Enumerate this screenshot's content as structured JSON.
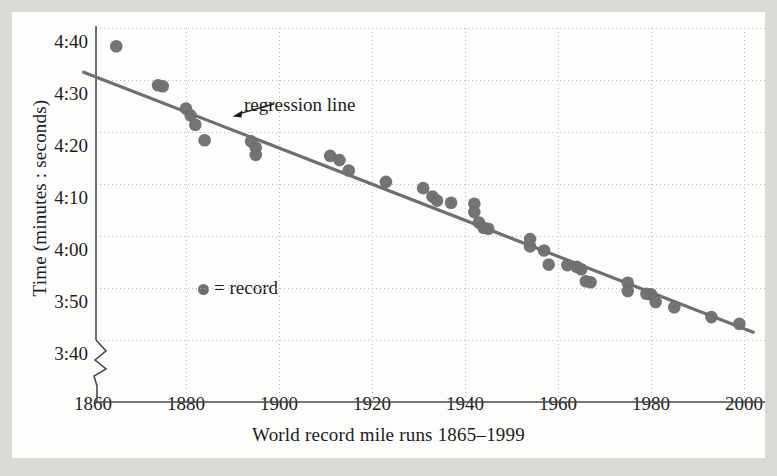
{
  "chart_data": {
    "type": "scatter",
    "title": "",
    "xlabel": "World record mile runs 1865–1999",
    "ylabel": "Time (minutes : seconds)",
    "xlim": [
      1857,
      2003
    ],
    "ylim_seconds": [
      215,
      285
    ],
    "ytick_labels": [
      "4:40",
      "4:30",
      "4:20",
      "4:10",
      "4:00",
      "3:50",
      "3:40"
    ],
    "ytick_seconds": [
      280,
      270,
      260,
      250,
      240,
      230,
      220
    ],
    "xtick_labels": [
      "1860",
      "1880",
      "1900",
      "1920",
      "1940",
      "1960",
      "1980",
      "2000"
    ],
    "xtick_values": [
      1860,
      1880,
      1900,
      1920,
      1940,
      1960,
      1980,
      2000
    ],
    "grid": true,
    "y_axis_break": true,
    "legend": {
      "position": "inside-left",
      "entries": [
        {
          "marker": "filled-circle",
          "label": "= record",
          "color": "#6f6f6f"
        }
      ]
    },
    "annotations": [
      {
        "text": "regression line",
        "x": 1898,
        "y_seconds": 265,
        "arrow_to_x": 1890,
        "arrow_to_y_seconds": 263
      }
    ],
    "series": [
      {
        "name": "record",
        "marker": "filled-circle",
        "color": "#6f6f6f",
        "points": [
          {
            "year": 1865,
            "time": "4:36.5",
            "seconds": 276.5
          },
          {
            "year": 1874,
            "time": "4:29.0",
            "seconds": 269.0
          },
          {
            "year": 1875,
            "time": "4:28.8",
            "seconds": 268.8
          },
          {
            "year": 1880,
            "time": "4:24.5",
            "seconds": 264.5
          },
          {
            "year": 1881,
            "time": "4:23.2",
            "seconds": 263.2
          },
          {
            "year": 1882,
            "time": "4:21.4",
            "seconds": 261.4
          },
          {
            "year": 1884,
            "time": "4:18.4",
            "seconds": 258.4
          },
          {
            "year": 1894,
            "time": "4:18.2",
            "seconds": 258.2
          },
          {
            "year": 1895,
            "time": "4:17.0",
            "seconds": 257.0
          },
          {
            "year": 1895,
            "time": "4:15.6",
            "seconds": 255.6
          },
          {
            "year": 1911,
            "time": "4:15.4",
            "seconds": 255.4
          },
          {
            "year": 1913,
            "time": "4:14.6",
            "seconds": 254.6
          },
          {
            "year": 1915,
            "time": "4:12.6",
            "seconds": 252.6
          },
          {
            "year": 1923,
            "time": "4:10.4",
            "seconds": 250.4
          },
          {
            "year": 1931,
            "time": "4:09.2",
            "seconds": 249.2
          },
          {
            "year": 1933,
            "time": "4:07.6",
            "seconds": 247.6
          },
          {
            "year": 1934,
            "time": "4:06.8",
            "seconds": 246.8
          },
          {
            "year": 1937,
            "time": "4:06.4",
            "seconds": 246.4
          },
          {
            "year": 1942,
            "time": "4:06.2",
            "seconds": 246.2
          },
          {
            "year": 1942,
            "time": "4:04.6",
            "seconds": 244.6
          },
          {
            "year": 1943,
            "time": "4:02.6",
            "seconds": 242.6
          },
          {
            "year": 1944,
            "time": "4:01.6",
            "seconds": 241.6
          },
          {
            "year": 1945,
            "time": "4:01.4",
            "seconds": 241.4
          },
          {
            "year": 1954,
            "time": "3:59.4",
            "seconds": 239.4
          },
          {
            "year": 1954,
            "time": "3:58.0",
            "seconds": 238.0
          },
          {
            "year": 1957,
            "time": "3:57.2",
            "seconds": 237.2
          },
          {
            "year": 1958,
            "time": "3:54.5",
            "seconds": 234.5
          },
          {
            "year": 1962,
            "time": "3:54.4",
            "seconds": 234.4
          },
          {
            "year": 1964,
            "time": "3:54.1",
            "seconds": 234.1
          },
          {
            "year": 1965,
            "time": "3:53.6",
            "seconds": 233.6
          },
          {
            "year": 1966,
            "time": "3:51.3",
            "seconds": 231.3
          },
          {
            "year": 1967,
            "time": "3:51.1",
            "seconds": 231.1
          },
          {
            "year": 1975,
            "time": "3:49.4",
            "seconds": 229.4
          },
          {
            "year": 1975,
            "time": "3:51.0",
            "seconds": 231.0
          },
          {
            "year": 1979,
            "time": "3:48.9",
            "seconds": 228.9
          },
          {
            "year": 1980,
            "time": "3:48.8",
            "seconds": 228.8
          },
          {
            "year": 1981,
            "time": "3:47.3",
            "seconds": 227.3
          },
          {
            "year": 1985,
            "time": "3:46.3",
            "seconds": 226.3
          },
          {
            "year": 1993,
            "time": "3:44.4",
            "seconds": 224.4
          },
          {
            "year": 1999,
            "time": "3:43.1",
            "seconds": 223.1
          }
        ]
      }
    ],
    "regression_line": {
      "name": "regression line",
      "color": "#6f6f6f",
      "x_start": 1858,
      "y_start_seconds": 271.5,
      "x_end": 2002,
      "y_end_seconds": 221.5
    }
  }
}
